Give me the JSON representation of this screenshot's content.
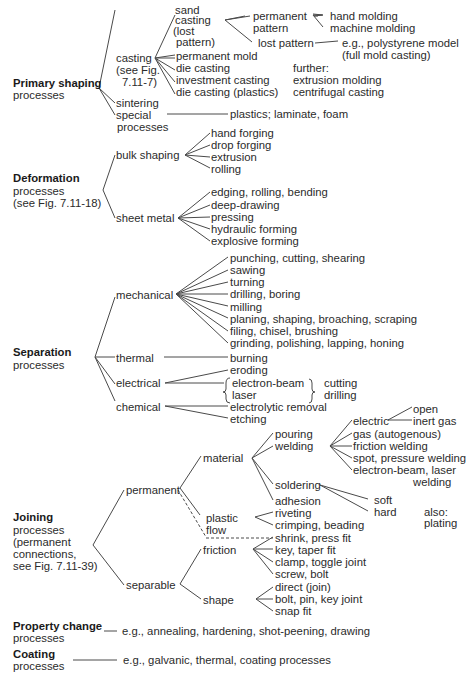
{
  "diagram": {
    "primary_shaping": {
      "title": "Primary shaping",
      "subtitle": "processes",
      "casting": {
        "label": [
          "casting",
          "(see Fig.",
          "7.11-7)"
        ],
        "sand_casting": [
          "sand",
          "casting",
          "(lost",
          "pattern)"
        ],
        "permanent_pattern": [
          "permanent",
          "pattern"
        ],
        "permanent_pattern_children": [
          "hand molding",
          "machine molding"
        ],
        "lost_pattern": "lost pattern",
        "lost_pattern_children": [
          "e.g., polystyrene model",
          "(full mold casting)"
        ],
        "children": [
          "permanent mold",
          "die casting",
          "investment casting",
          "die casting (plastics)"
        ],
        "further": [
          "further:",
          "extrusion molding",
          "centrifugal casting"
        ]
      },
      "sintering": "sintering",
      "special": [
        "special",
        "processes"
      ],
      "special_children": "plastics; laminate, foam"
    },
    "deformation": {
      "title": "Deformation",
      "subtitle": [
        "processes",
        "(see Fig. 7.11-18)"
      ],
      "bulk_shaping": "bulk shaping",
      "bulk_children": [
        "hand forging",
        "drop forging",
        "extrusion",
        "rolling"
      ],
      "sheet_metal": "sheet metal",
      "sheet_children": [
        "edging, rolling, bending",
        "deep-drawing",
        "pressing",
        "hydraulic forming",
        "explosive forming"
      ]
    },
    "separation": {
      "title": "Separation",
      "subtitle": "processes",
      "mechanical": "mechanical",
      "mechanical_children": [
        "punching, cutting, shearing",
        "sawing",
        "turning",
        "drilling, boring",
        "milling",
        "planing, shaping, broaching, scraping",
        "filing, chisel, brushing",
        "grinding, polishing, lapping, honing"
      ],
      "thermal": "thermal",
      "thermal_children": [
        "burning"
      ],
      "electrical": "electrical",
      "electrical_children": [
        "eroding",
        "electron-beam",
        "laser"
      ],
      "electrical_uses": [
        "cutting",
        "drilling"
      ],
      "chemical": "chemical",
      "chemical_children": [
        "electrolytic removal",
        "etching"
      ]
    },
    "joining": {
      "title": "Joining",
      "subtitle": [
        "processes",
        "(permanent",
        "connections,",
        "see Fig. 7.11-39)"
      ],
      "permanent": "permanent",
      "material": "material",
      "material_children": [
        "pouring",
        "welding",
        "soldering",
        "adhesion"
      ],
      "welding_children": [
        "electric",
        "gas (autogenous)",
        "friction welding",
        "spot, pressure welding",
        "electron-beam, laser",
        "welding"
      ],
      "electric_children": [
        "open",
        "inert gas"
      ],
      "soldering_children": [
        "soft",
        "hard"
      ],
      "also": [
        "also:",
        "plating"
      ],
      "plastic_flow": [
        "plastic",
        "flow"
      ],
      "plastic_flow_children": [
        "riveting",
        "crimping, beading"
      ],
      "shrink": "shrink, press fit",
      "separable": "separable",
      "friction": "friction",
      "friction_children": [
        "key, taper fit",
        "clamp, toggle joint",
        "screw, bolt"
      ],
      "shape": "shape",
      "shape_children": [
        "direct (join)",
        "bolt, pin, key joint",
        "snap fit"
      ]
    },
    "property_change": {
      "title": "Property change",
      "subtitle": "processes",
      "examples": "e.g., annealing, hardening, shot-peening, drawing"
    },
    "coating": {
      "title": "Coating",
      "subtitle": "processes",
      "examples": "e.g., galvanic, thermal, coating processes"
    }
  }
}
